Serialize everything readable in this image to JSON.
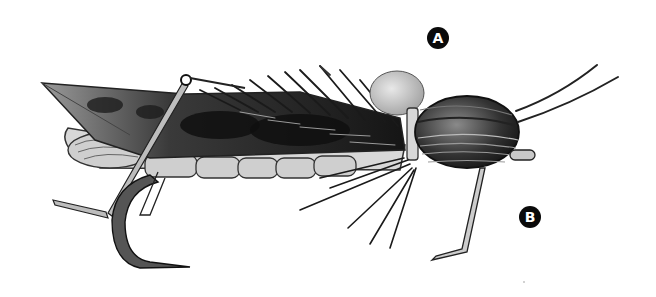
{
  "illustration": {
    "subject": "grasshopper hopper fly pattern on hook",
    "style": "grayscale pen-and-ink",
    "background_color": "#ffffff",
    "ink_color": "#111111"
  },
  "callouts": [
    {
      "id": "A",
      "label": "A"
    },
    {
      "id": "B",
      "label": "B"
    }
  ]
}
